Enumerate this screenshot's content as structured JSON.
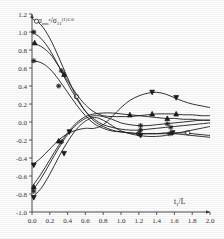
{
  "figure": {
    "background_color": "#fefefe",
    "line_color": "#1c1c1c"
  },
  "axis": {
    "x_label_main": "t",
    "x_label_sub": "1",
    "x_label_tail": "/",
    "x_label_unit": "L",
    "y_label_num_main": "σ",
    "y_label_num_sub": "mn",
    "y_label_num_sup": "z",
    "y_label_slash": "/",
    "y_label_den_main": "σ",
    "y_label_den_sub": "11",
    "y_label_den_sup": "(1)1.0",
    "x_ticks": [
      "0.0",
      "0.2",
      "0.4",
      "0.6",
      "0.8",
      "1.0",
      "1.2",
      "1.4",
      "1.6",
      "1.8",
      "2.0"
    ],
    "y_ticks": [
      "1.2",
      "1.0",
      "0.8",
      "0.6",
      "0.4",
      "0.2",
      "0.0",
      "-0.2",
      "-0.4",
      "-0.6",
      "-0.8",
      "-1.0"
    ]
  },
  "chart_data": {
    "type": "line",
    "title": "",
    "xlabel": "t1/L",
    "ylabel": "sigma_mn^z / sigma_11^(1)1.0",
    "xlim": [
      0.0,
      2.0
    ],
    "ylim": [
      -1.0,
      1.2
    ],
    "grid": false,
    "legend": "none",
    "x": [
      0.0,
      0.1,
      0.2,
      0.3,
      0.4,
      0.5,
      0.6,
      0.7,
      0.8,
      0.9,
      1.0,
      1.1,
      1.2,
      1.3,
      1.4,
      1.5,
      1.6,
      1.7,
      1.8,
      1.9,
      2.0
    ],
    "series": [
      {
        "name": "curve-1-open-circle",
        "marker": "open-circle",
        "start_value": 1.15,
        "values": [
          1.15,
          1.08,
          0.93,
          0.72,
          0.49,
          0.28,
          0.12,
          0.01,
          -0.05,
          -0.09,
          -0.11,
          -0.12,
          -0.13,
          -0.13,
          -0.13,
          -0.12,
          -0.12,
          -0.12,
          -0.13,
          -0.14,
          -0.15
        ],
        "marker_points": [
          [
            0.05,
            1.12
          ],
          [
            0.5,
            0.28
          ],
          [
            1.2,
            -0.13
          ],
          [
            1.75,
            -0.12
          ]
        ]
      },
      {
        "name": "curve-2-star",
        "marker": "star",
        "start_value": 1.0,
        "values": [
          1.0,
          0.93,
          0.8,
          0.62,
          0.43,
          0.26,
          0.12,
          0.03,
          -0.03,
          -0.06,
          -0.08,
          -0.09,
          -0.09,
          -0.08,
          -0.07,
          -0.06,
          -0.05,
          -0.04,
          -0.03,
          -0.02,
          -0.01
        ],
        "marker_points": [
          [
            0.02,
            1.0
          ],
          [
            0.33,
            0.57
          ],
          [
            1.22,
            -0.09
          ],
          [
            1.56,
            -0.06
          ]
        ]
      },
      {
        "name": "curve-3-solid-tri",
        "marker": "solid-triangle",
        "start_value": 0.88,
        "values": [
          0.88,
          0.84,
          0.76,
          0.62,
          0.46,
          0.31,
          0.19,
          0.11,
          0.07,
          0.06,
          0.06,
          0.06,
          0.07,
          0.08,
          0.09,
          0.09,
          0.09,
          0.08,
          0.08,
          0.07,
          0.07
        ],
        "marker_points": [
          [
            0.03,
            0.88
          ],
          [
            0.36,
            0.53
          ],
          [
            1.35,
            0.09
          ],
          [
            1.62,
            0.09
          ]
        ]
      },
      {
        "name": "curve-4-star-low",
        "marker": "star",
        "start_value": 0.68,
        "values": [
          0.68,
          0.66,
          0.59,
          0.47,
          0.33,
          0.19,
          0.07,
          -0.02,
          -0.07,
          -0.1,
          -0.11,
          -0.12,
          -0.13,
          -0.13,
          -0.13,
          -0.13,
          -0.13,
          -0.14,
          -0.15,
          -0.16,
          -0.17
        ],
        "marker_points": [
          [
            0.02,
            0.68
          ],
          [
            0.3,
            0.4
          ],
          [
            1.2,
            -0.13
          ],
          [
            1.55,
            -0.13
          ]
        ]
      },
      {
        "name": "curve-5-down-tri",
        "marker": "down-triangle",
        "start_value": -0.48,
        "values": [
          -0.48,
          -0.4,
          -0.3,
          -0.2,
          -0.13,
          -0.09,
          -0.07,
          -0.07,
          -0.03,
          0.06,
          0.16,
          0.24,
          0.29,
          0.32,
          0.33,
          0.31,
          0.27,
          0.23,
          0.2,
          0.18,
          0.16
        ],
        "marker_points": [
          [
            0.02,
            -0.48
          ],
          [
            0.42,
            -0.11
          ],
          [
            1.35,
            0.33
          ],
          [
            1.62,
            0.27
          ]
        ]
      },
      {
        "name": "curve-6-solid-tri-low",
        "marker": "solid-triangle",
        "start_value": -0.72,
        "values": [
          -0.72,
          -0.58,
          -0.42,
          -0.26,
          -0.12,
          -0.01,
          0.06,
          0.09,
          0.1,
          0.1,
          0.09,
          0.08,
          0.07,
          0.06,
          0.05,
          0.04,
          0.04,
          0.03,
          0.03,
          0.02,
          0.02
        ],
        "marker_points": [
          [
            0.02,
            -0.72
          ],
          [
            0.3,
            -0.21
          ],
          [
            1.1,
            0.08
          ],
          [
            1.52,
            0.04
          ]
        ]
      },
      {
        "name": "curve-7-star-low2",
        "marker": "star",
        "start_value": -0.77,
        "values": [
          -0.77,
          -0.63,
          -0.46,
          -0.29,
          -0.14,
          -0.03,
          0.04,
          0.07,
          0.06,
          0.03,
          -0.01,
          -0.03,
          -0.04,
          -0.04,
          -0.03,
          -0.02,
          -0.01,
          0.0,
          0.01,
          0.02,
          0.02
        ],
        "marker_points": [
          [
            0.02,
            -0.77
          ],
          [
            0.33,
            -0.22
          ],
          [
            1.22,
            -0.04
          ],
          [
            1.52,
            -0.02
          ]
        ]
      },
      {
        "name": "curve-8-solid-down",
        "marker": "down-triangle",
        "start_value": -0.84,
        "values": [
          -0.84,
          -0.74,
          -0.58,
          -0.39,
          -0.22,
          -0.08,
          0.01,
          0.05,
          0.02,
          -0.04,
          -0.1,
          -0.13,
          -0.15,
          -0.16,
          -0.16,
          -0.15,
          -0.13,
          -0.11,
          -0.09,
          -0.07,
          -0.05
        ],
        "marker_points": [
          [
            0.02,
            -0.84
          ],
          [
            0.36,
            -0.35
          ],
          [
            1.22,
            -0.15
          ],
          [
            1.58,
            -0.12
          ]
        ]
      }
    ]
  }
}
